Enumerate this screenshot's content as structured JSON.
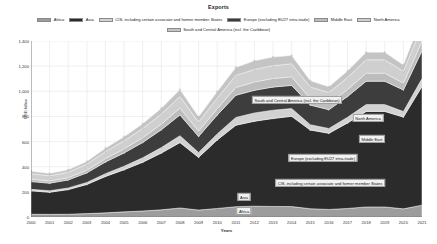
{
  "title": "Exports",
  "axis": {
    "ylabel": "USD billion",
    "xlabel": "Years"
  },
  "legend": {
    "row1": [
      {
        "label": "Africa",
        "color": "#9c9c9c"
      },
      {
        "label": "Asia",
        "color": "#2b2b2b"
      },
      {
        "label": "CIS, including certain associate and former member States",
        "color": "#d2d2d2"
      },
      {
        "label": "Europe (excluding EU27 intra-trade)",
        "color": "#3d3d3d"
      },
      {
        "label": "Middle East",
        "color": "#bdbdbd"
      },
      {
        "label": "North America",
        "color": "#cfcfcf"
      }
    ],
    "row2": [
      {
        "label": "South and Central America (incl. the Caribbean)",
        "color": "#c4c4c4"
      }
    ]
  },
  "annotations": [
    {
      "name": "south-central-america",
      "label": "South and Central America (incl. the Caribbean)",
      "x": 297,
      "y": 100
    },
    {
      "name": "north-america",
      "label": "North America",
      "x": 368,
      "y": 118
    },
    {
      "name": "middle-east",
      "label": "Middle East",
      "x": 372,
      "y": 139
    },
    {
      "name": "europe",
      "label": "Europe (excluding EU27 intra-trade)",
      "x": 323,
      "y": 158
    },
    {
      "name": "cis",
      "label": "CIS, including certain associate and former member States",
      "x": 330,
      "y": 183
    },
    {
      "name": "asia",
      "label": "Asia",
      "x": 244,
      "y": 197
    },
    {
      "name": "africa",
      "label": "Africa",
      "x": 244,
      "y": 211
    }
  ],
  "chart_data": {
    "type": "area",
    "stacked": true,
    "title": "Exports",
    "xlabel": "Years",
    "ylabel": "USD billion",
    "grid": true,
    "legend_position": "top",
    "ylim": [
      0,
      1400
    ],
    "yticks": [
      0,
      200,
      400,
      600,
      800,
      1000,
      1200,
      1400
    ],
    "ytick_labels": [
      "0",
      "200",
      "400",
      "600",
      "800",
      "1,000",
      "1,200",
      "1,400"
    ],
    "categories": [
      2000,
      2001,
      2002,
      2003,
      2004,
      2005,
      2006,
      2007,
      2008,
      2009,
      2010,
      2011,
      2012,
      2013,
      2014,
      2015,
      2016,
      2017,
      2018,
      2019,
      2020,
      2021
    ],
    "series": [
      {
        "name": "Africa",
        "color": "#9c9c9c",
        "values": [
          22,
          21,
          22,
          27,
          33,
          41,
          48,
          57,
          72,
          55,
          68,
          82,
          86,
          84,
          83,
          66,
          60,
          68,
          80,
          80,
          65,
          94
        ]
      },
      {
        "name": "Asia",
        "color": "#2b2b2b",
        "values": [
          186,
          176,
          196,
          232,
          290,
          335,
          388,
          452,
          520,
          420,
          545,
          648,
          676,
          700,
          718,
          626,
          606,
          680,
          760,
          760,
          730,
          945
        ]
      },
      {
        "name": "CIS, including certain associate and former member States",
        "color": "#d2d2d2",
        "values": [
          12,
          12,
          13,
          16,
          22,
          28,
          35,
          43,
          55,
          38,
          48,
          62,
          66,
          66,
          62,
          42,
          38,
          45,
          54,
          54,
          44,
          62
        ]
      },
      {
        "name": "Europe (excluding EU27 intra-trade)",
        "color": "#3d3d3d",
        "values": [
          62,
          60,
          64,
          76,
          93,
          106,
          122,
          142,
          165,
          128,
          150,
          176,
          180,
          184,
          184,
          156,
          150,
          166,
          186,
          186,
          172,
          222
        ]
      },
      {
        "name": "Middle East",
        "color": "#bdbdbd",
        "values": [
          18,
          17,
          18,
          21,
          26,
          32,
          38,
          45,
          56,
          42,
          50,
          62,
          66,
          68,
          68,
          52,
          48,
          55,
          64,
          64,
          54,
          74
        ]
      },
      {
        "name": "North America",
        "color": "#cfcfcf",
        "values": [
          44,
          42,
          43,
          48,
          56,
          64,
          72,
          80,
          90,
          72,
          84,
          96,
          100,
          102,
          104,
          92,
          88,
          96,
          106,
          106,
          94,
          118
        ]
      },
      {
        "name": "South and Central America (incl. the Caribbean)",
        "color": "#c4c4c4",
        "values": [
          20,
          19,
          19,
          22,
          27,
          33,
          39,
          46,
          56,
          42,
          52,
          64,
          68,
          68,
          66,
          50,
          46,
          52,
          60,
          60,
          50,
          70
        ]
      }
    ]
  }
}
